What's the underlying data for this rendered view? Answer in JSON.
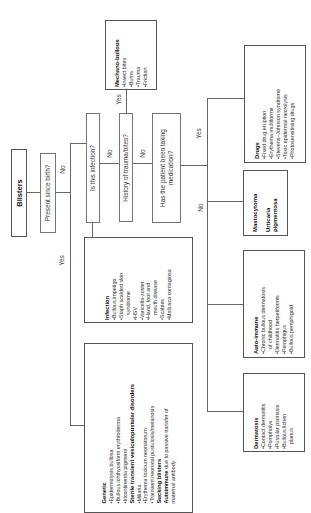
{
  "root": {
    "label": "Blisters"
  },
  "questions": {
    "q1": "Present since birth?",
    "q2": "Is this infection?",
    "q3": "History of trauma/bites?",
    "q4_line1": "Has the patient been taking",
    "q4_line2": "medication?"
  },
  "edge_labels": {
    "q1_no": "No",
    "q1_yes": "Yes",
    "q2_no": "No",
    "q3_no": "No",
    "q3_yes": "Yes",
    "q4_yes": "Yes",
    "q4_no": "No"
  },
  "outcomes": {
    "mechano": {
      "title": "Mechano-bullous",
      "items": [
        "Insect bites",
        "Burns",
        "Trauma",
        "Friction"
      ]
    },
    "drugs": {
      "title": "Drugs",
      "items": [
        "Fixed drug eruption",
        "Erythema multiforme",
        "Stevens–Johnson syndrome",
        "Toxic epidermal necrolysis",
        "Photosensitising drugs"
      ]
    },
    "mastocytoma": {
      "line1": "Mastocytoma",
      "line2": "Urticaria",
      "line3": "pigmentosa"
    },
    "autoimmune": {
      "title": "Auto-immune",
      "items": [
        "Chronic bullous dermatosis",
        "of childhood",
        "Dermatitis herpetiformis",
        "Pemphigus",
        "Bullous pemphigoid"
      ]
    },
    "dermatosis": {
      "title": "Dermatosis",
      "items": [
        "Contact dermatitis",
        "Pompholyx",
        "Pustular psoriasis",
        "Bullous lichen",
        "planus"
      ]
    },
    "infection": {
      "title": "Infection",
      "items": [
        "Bullous impetigo",
        "Staph scalded skin",
        "syndrome",
        "HSV",
        "Varicella-zoster",
        "Hand, foot and",
        "mouth disease",
        "Scabies",
        "Mollusca contagiosa"
      ]
    },
    "genetic": {
      "title": "Genetic",
      "items": [
        "Epidermolysis bullosa",
        "Bullous ichthyosiform erythroderma",
        "Incontinentia pigmenti"
      ],
      "sterile_title": "Sterile transient vesiculopustular disorders",
      "sterile_items": [
        "Miliaria",
        "Erythema toxicum neonatorum",
        "Transient neonatal pustulosis/melanosis"
      ],
      "sucking": "Sucking blisters",
      "autoimmune_bold": "Autoimmune",
      "autoimmune_rest": " due to passive transfer of",
      "autoimmune_line2": "maternal antibody"
    }
  }
}
